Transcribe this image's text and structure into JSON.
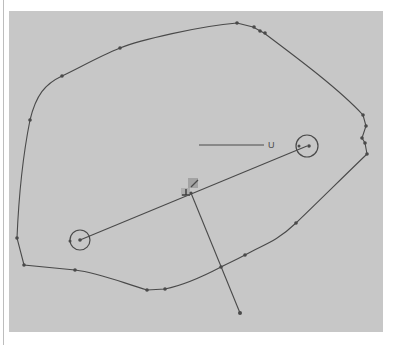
{
  "viewport": {
    "background": "#c7c7c7",
    "stroke_color": "#4a4a4a"
  },
  "outline": {
    "points": [
      [
        62,
        76
      ],
      [
        120,
        48
      ],
      [
        237,
        23
      ],
      [
        253,
        27
      ],
      [
        260,
        31
      ],
      [
        264,
        33
      ],
      [
        363,
        115
      ],
      [
        366,
        126
      ],
      [
        362,
        138
      ],
      [
        365,
        143
      ],
      [
        367,
        154
      ],
      [
        296,
        223
      ],
      [
        245,
        255
      ],
      [
        221,
        267
      ],
      [
        165,
        289
      ],
      [
        147,
        290
      ],
      [
        75,
        270
      ],
      [
        24,
        265
      ],
      [
        17,
        238
      ],
      [
        30,
        120
      ]
    ]
  },
  "axis_label": {
    "text": "U",
    "line": [
      [
        199,
        145
      ],
      [
        264,
        145
      ]
    ],
    "pos": [
      268,
      148
    ]
  },
  "handles": [
    {
      "name": "left-handle",
      "center": [
        80,
        240
      ],
      "r": 10
    },
    {
      "name": "right-handle",
      "center": [
        307,
        146
      ],
      "r": 11
    }
  ],
  "main_line": [
    [
      80,
      240
    ],
    [
      307,
      146
    ]
  ],
  "cross_line": [
    [
      191,
      193
    ],
    [
      240,
      313
    ]
  ],
  "origin_marker": {
    "pos": [
      186,
      193
    ],
    "label": "⊥"
  }
}
